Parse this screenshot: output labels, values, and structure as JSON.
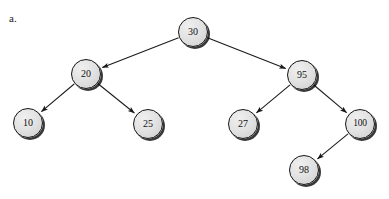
{
  "figure": {
    "label": "a.",
    "type": "binary-search-tree",
    "background_color": "#ffffff",
    "node_fill_color": "#e3e3e3",
    "node_border_color": "#141414",
    "edge_color": "#1a1a1a",
    "text_color": "#111111"
  },
  "tree": {
    "root": "30",
    "nodes": [
      {
        "id": "n30",
        "value": "30",
        "cx": 193,
        "cy": 32,
        "r": 15,
        "level": 0
      },
      {
        "id": "n20",
        "value": "20",
        "cx": 86,
        "cy": 74,
        "r": 15,
        "level": 1
      },
      {
        "id": "n95",
        "value": "95",
        "cx": 302,
        "cy": 75,
        "r": 15,
        "level": 1
      },
      {
        "id": "n10",
        "value": "10",
        "cx": 28,
        "cy": 123,
        "r": 15,
        "level": 2
      },
      {
        "id": "n25",
        "value": "25",
        "cx": 148,
        "cy": 124,
        "r": 15,
        "level": 2
      },
      {
        "id": "n27",
        "value": "27",
        "cx": 243,
        "cy": 124,
        "r": 15,
        "level": 2
      },
      {
        "id": "n100",
        "value": "100",
        "cx": 360,
        "cy": 124,
        "r": 15,
        "level": 2
      },
      {
        "id": "n98",
        "value": "98",
        "cx": 304,
        "cy": 170,
        "r": 15,
        "level": 3
      }
    ],
    "edges": [
      {
        "from": "n30",
        "to": "n20",
        "direction": "left"
      },
      {
        "from": "n30",
        "to": "n95",
        "direction": "right"
      },
      {
        "from": "n20",
        "to": "n10",
        "direction": "left"
      },
      {
        "from": "n20",
        "to": "n25",
        "direction": "right"
      },
      {
        "from": "n95",
        "to": "n27",
        "direction": "left"
      },
      {
        "from": "n95",
        "to": "n100",
        "direction": "right"
      },
      {
        "from": "n100",
        "to": "n98",
        "direction": "left"
      }
    ]
  }
}
